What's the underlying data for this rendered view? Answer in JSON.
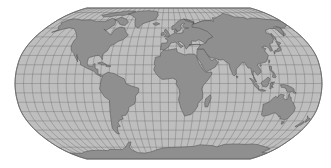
{
  "map": {
    "projection": "Robinson-like world map",
    "colors": {
      "background": "#ffffff",
      "ocean": "#bebebe",
      "land": "#8f8f8f",
      "coastline": "#4e4e4e",
      "graticule": "#6e6e6e",
      "border": "#6a6a6a"
    },
    "graticule": {
      "meridian_step_deg": 10,
      "parallel_step_deg": 10
    },
    "continents": [
      {
        "name": "North America"
      },
      {
        "name": "Greenland"
      },
      {
        "name": "South America"
      },
      {
        "name": "Europe"
      },
      {
        "name": "Africa"
      },
      {
        "name": "Asia"
      },
      {
        "name": "Australia"
      },
      {
        "name": "Antarctica"
      }
    ]
  }
}
